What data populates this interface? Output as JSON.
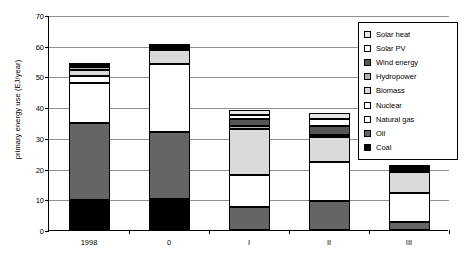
{
  "chart_data": {
    "type": "bar",
    "stacked": true,
    "title": "",
    "xlabel": "",
    "ylabel": "primary energy use (EJ/year)",
    "ylim": [
      0,
      70
    ],
    "ytick_step": 10,
    "yticks": [
      "0",
      "10",
      "20",
      "30",
      "40",
      "50",
      "60",
      "70"
    ],
    "grid": true,
    "legend_position": "right-inside-top",
    "categories": [
      "1998",
      "0",
      "I",
      "II",
      "III"
    ],
    "series": [
      {
        "name": "Coal",
        "color": "#000000",
        "values": [
          9.8,
          10.0,
          0.0,
          0.0,
          0.0
        ]
      },
      {
        "name": "Oil",
        "color": "#656565",
        "values": [
          25.2,
          22.0,
          7.5,
          9.5,
          2.5
        ]
      },
      {
        "name": "Natural gas",
        "color": "#ffffff",
        "values": [
          13.0,
          22.0,
          10.5,
          12.5,
          9.5
        ]
      },
      {
        "name": "Nuclear",
        "color": "#fdfdfd",
        "values": [
          2.2,
          0.0,
          0.0,
          0.0,
          0.0
        ]
      },
      {
        "name": "Biomass",
        "color": "#d9d9d9",
        "values": [
          2.0,
          4.6,
          14.8,
          8.2,
          7.0
        ]
      },
      {
        "name": "Hydropower",
        "color": "#b0b0b0",
        "values": [
          1.0,
          0.5,
          1.2,
          0.6,
          0.5
        ]
      },
      {
        "name": "Wind energy",
        "color": "#555555",
        "values": [
          0.2,
          0.4,
          2.0,
          3.2,
          0.8
        ]
      },
      {
        "name": "Solar PV",
        "color": "#ffffff",
        "values": [
          0.3,
          0.3,
          1.3,
          2.0,
          0.3
        ]
      },
      {
        "name": "Solar heat",
        "color": "#e6e6e6",
        "values": [
          0.3,
          0.2,
          1.7,
          2.0,
          0.4
        ]
      }
    ],
    "totals": [
      54.0,
      60.0,
      39.0,
      38.0,
      21.0
    ]
  },
  "legend": {
    "items": [
      {
        "label": "Solar heat",
        "color": "#e6e6e6"
      },
      {
        "label": "Solar PV",
        "color": "#ffffff"
      },
      {
        "label": "Wind energy",
        "color": "#555555"
      },
      {
        "label": "Hydropower",
        "color": "#b0b0b0"
      },
      {
        "label": "Biomass",
        "color": "#d9d9d9"
      },
      {
        "label": "Nuclear",
        "color": "#fdfdfd"
      },
      {
        "label": "Natural gas",
        "color": "#ffffff"
      },
      {
        "label": "Oil",
        "color": "#656565"
      },
      {
        "label": "Coal",
        "color": "#000000"
      }
    ]
  }
}
